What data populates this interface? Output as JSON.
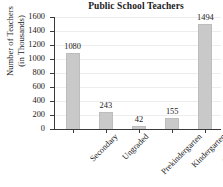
{
  "chart_data": {
    "type": "bar",
    "title": "Public School Teachers",
    "xlabel": "",
    "ylabel_line1": "Number of Teachers",
    "ylabel_line2": "(in Thousands)",
    "categories": [
      "Secondary",
      "Ungraded",
      "Prekindergarten",
      "Kindergarten",
      "Elementary"
    ],
    "values": [
      1080,
      243,
      42,
      155,
      1494
    ],
    "value_labels": [
      "1080",
      "243",
      "42",
      "155",
      "1494"
    ],
    "ylim": [
      0,
      1600
    ],
    "yticks": [
      0,
      200,
      400,
      600,
      800,
      1000,
      1200,
      1400,
      1600
    ],
    "ytick_labels": [
      "0",
      "200",
      "400",
      "600",
      "800",
      "1000",
      "1200",
      "1400",
      "1600"
    ],
    "grid": true,
    "legend": "none",
    "bar_color": "#c9c9c9",
    "axis_color": "#3a3a3a",
    "grid_color": "#ededed",
    "text_color": "#1a1a1a"
  }
}
